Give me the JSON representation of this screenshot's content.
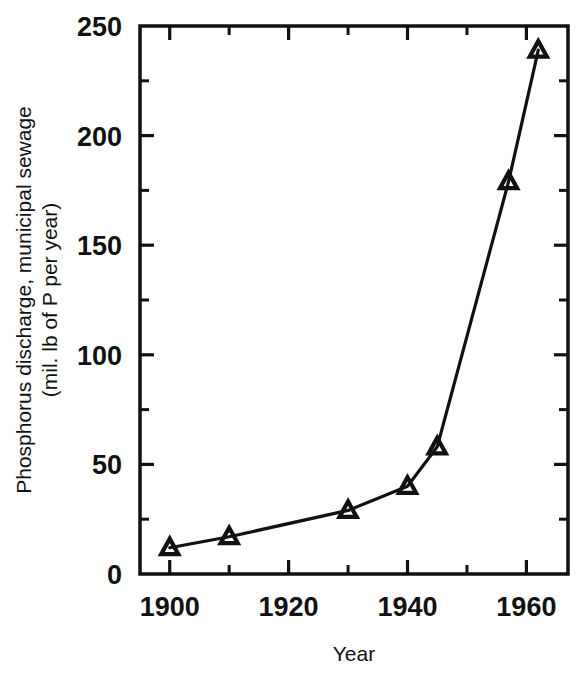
{
  "chart_data": {
    "type": "line",
    "title": "",
    "xlabel": "Year",
    "ylabel_line1": "Phosphorus discharge, municipal sewage",
    "ylabel_line2": "(mil. lb of P per year)",
    "xlim": [
      1895,
      1967
    ],
    "ylim": [
      0,
      250
    ],
    "grid": false,
    "legend": null,
    "marker": "triangle",
    "line_color": "#111111",
    "x_major_ticks": [
      1900,
      1920,
      1940,
      1960
    ],
    "x_major_tick_labels": [
      "1900",
      "1920",
      "1940",
      "1960"
    ],
    "x_minor_ticks": [
      1910,
      1930,
      1950
    ],
    "y_major_ticks": [
      0,
      50,
      100,
      150,
      200,
      250
    ],
    "y_major_tick_labels": [
      "0",
      "50",
      "100",
      "150",
      "200",
      "250"
    ],
    "y_minor_ticks": [
      25,
      75,
      125,
      175,
      225
    ],
    "x": [
      1900,
      1910,
      1930,
      1940,
      1945,
      1957,
      1962
    ],
    "values": [
      12,
      17,
      29,
      40,
      58,
      179,
      239
    ],
    "points": [
      {
        "x": 1900,
        "y": 12
      },
      {
        "x": 1910,
        "y": 17
      },
      {
        "x": 1930,
        "y": 29
      },
      {
        "x": 1940,
        "y": 40
      },
      {
        "x": 1945,
        "y": 58
      },
      {
        "x": 1957,
        "y": 179
      },
      {
        "x": 1962,
        "y": 239
      }
    ]
  },
  "colors": {
    "ink": "#111111",
    "background": "#ffffff"
  }
}
